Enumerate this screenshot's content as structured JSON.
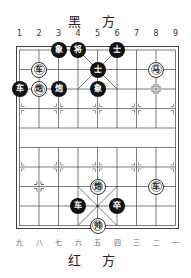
{
  "top_side": {
    "label": "黑 方"
  },
  "bottom_side": {
    "label": "红 方"
  },
  "top_columns": [
    "1",
    "2",
    "3",
    "4",
    "5",
    "6",
    "7",
    "8",
    "9"
  ],
  "bottom_columns": [
    "九",
    "八",
    "七",
    "六",
    "五",
    "四",
    "三",
    "二",
    "一"
  ],
  "board": {
    "columns": 9,
    "rows": 10,
    "colors": {
      "line": "#444444",
      "black_piece": "#111111",
      "red_piece_fill": "#ffffff"
    }
  },
  "pieces": [
    {
      "side": "black",
      "char": "象",
      "col": 3,
      "row": 1
    },
    {
      "side": "black",
      "char": "将",
      "col": 4,
      "row": 1
    },
    {
      "side": "black",
      "char": "士",
      "col": 6,
      "row": 1
    },
    {
      "side": "red",
      "char": "车",
      "col": 2,
      "row": 2
    },
    {
      "side": "black",
      "char": "士",
      "col": 5,
      "row": 2
    },
    {
      "side": "red",
      "char": "马",
      "col": 8,
      "row": 2
    },
    {
      "side": "black",
      "char": "车",
      "col": 1,
      "row": 3
    },
    {
      "side": "red",
      "char": "炮",
      "col": 2,
      "row": 3
    },
    {
      "side": "black",
      "char": "炮",
      "col": 3,
      "row": 3
    },
    {
      "side": "black",
      "char": "象",
      "col": 5,
      "row": 3
    },
    {
      "side": "red",
      "char": "炮",
      "col": 5,
      "row": 8
    },
    {
      "side": "red",
      "char": "车",
      "col": 8,
      "row": 8
    },
    {
      "side": "black",
      "char": "车",
      "col": 4,
      "row": 9
    },
    {
      "side": "black",
      "char": "卒",
      "col": 6,
      "row": 9
    },
    {
      "side": "red",
      "char": "帅",
      "col": 5,
      "row": 10
    }
  ]
}
